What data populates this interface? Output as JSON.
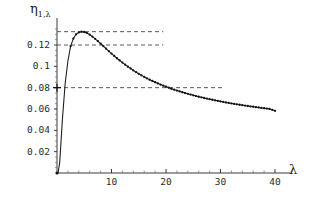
{
  "chart_data": {
    "type": "line",
    "title": "",
    "subtitle": "",
    "xlabel": "λ",
    "ylabel": "η",
    "ylabel_subscript": "1,λ",
    "xlim": [
      0,
      41
    ],
    "ylim": [
      0,
      0.142
    ],
    "grid": false,
    "legend": null,
    "marker": "point",
    "line_color": "#1a1a1a",
    "marker_color": "#111111",
    "xticks": [
      10,
      20,
      30,
      40
    ],
    "xtick_labels": [
      "10",
      "20",
      "30",
      "40"
    ],
    "yticks": [
      0.02,
      0.04,
      0.06,
      0.08,
      0.1,
      0.12
    ],
    "ytick_labels": [
      "0.02",
      "0.04",
      "0.06",
      "0.08",
      "0.1",
      "0.12"
    ],
    "x": [
      0.2,
      0.5,
      1,
      1.5,
      2,
      2.5,
      3,
      3.5,
      4,
      4.5,
      5,
      5.5,
      6,
      6.5,
      7,
      7.5,
      8,
      8.5,
      9,
      9.5,
      10,
      11,
      12,
      13,
      14,
      15,
      16,
      17,
      18,
      19,
      20,
      21,
      22,
      23,
      24,
      25,
      26,
      27,
      28,
      29,
      30,
      31,
      32,
      33,
      34,
      35,
      36,
      37,
      38,
      39,
      40
    ],
    "y": [
      0.0005,
      0.01,
      0.051,
      0.084,
      0.105,
      0.119,
      0.126,
      0.13,
      0.1318,
      0.1325,
      0.1322,
      0.1312,
      0.1297,
      0.1279,
      0.1258,
      0.1236,
      0.1213,
      0.119,
      0.1166,
      0.1143,
      0.112,
      0.1076,
      0.1035,
      0.0997,
      0.0962,
      0.093,
      0.0901,
      0.0875,
      0.0851,
      0.0829,
      0.0809,
      0.079,
      0.0773,
      0.0757,
      0.0742,
      0.0728,
      0.0715,
      0.0703,
      0.0692,
      0.0681,
      0.0671,
      0.0661,
      0.0652,
      0.0644,
      0.0636,
      0.0628,
      0.0621,
      0.0614,
      0.0607,
      0.0601,
      0.0583
    ],
    "annotations": [
      {
        "name": "dashed-line-peak",
        "type": "hline",
        "value": 0.1325,
        "x_start": 0,
        "x_end": 19.5,
        "style": "dashed"
      },
      {
        "name": "dashed-line-0.12",
        "type": "hline",
        "value": 0.12,
        "x_start": 0,
        "x_end": 19.5,
        "style": "dashed"
      },
      {
        "name": "dashed-line-0.08",
        "type": "hline",
        "value": 0.08,
        "x_start": 0,
        "x_end": 30.5,
        "style": "dashed"
      },
      {
        "name": "cross-marker-0.08",
        "type": "cross",
        "x": 0,
        "y": 0.08
      }
    ],
    "peak": {
      "x": 4.7,
      "y": 0.1325
    },
    "endpoint": {
      "x": 40,
      "y": 0.0583
    }
  },
  "axes": {
    "y_axis_name": "η",
    "y_axis_subscript": "1,λ",
    "x_axis_name": "λ"
  }
}
